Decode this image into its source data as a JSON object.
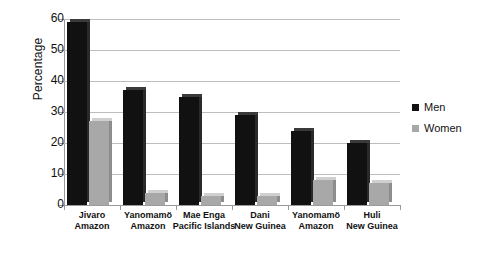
{
  "chart_data": {
    "type": "bar",
    "title": "",
    "xlabel": "",
    "ylabel": "Percentage",
    "ylim": [
      0,
      60
    ],
    "yticks": [
      0,
      10,
      20,
      30,
      40,
      50,
      60
    ],
    "grid": true,
    "legend_position": "right",
    "categories": [
      "Jivaro\nAmazon",
      "Yanomamö\nAmazon",
      "Mae Enga\nPacific Islands",
      "Dani\nNew Guinea",
      "Yanomamö\nAmazon",
      "Huli\nNew Guinea"
    ],
    "category_lines": [
      [
        "Jivaro",
        "Amazon"
      ],
      [
        "Yanomamö",
        "Amazon"
      ],
      [
        "Mae Enga",
        "Pacific Islands"
      ],
      [
        "Dani",
        "New Guinea"
      ],
      [
        "Yanomamö",
        "Amazon"
      ],
      [
        "Huli",
        "New Guinea"
      ]
    ],
    "series": [
      {
        "name": "Men",
        "color": "#111111",
        "values": [
          59,
          37,
          35,
          29,
          24,
          20
        ]
      },
      {
        "name": "Women",
        "color": "#a8a8a8",
        "values": [
          27,
          4,
          3,
          3,
          8,
          7
        ]
      }
    ]
  },
  "legend": {
    "items": [
      {
        "label": "Men",
        "color": "#111111"
      },
      {
        "label": "Women",
        "color": "#a8a8a8"
      }
    ]
  }
}
